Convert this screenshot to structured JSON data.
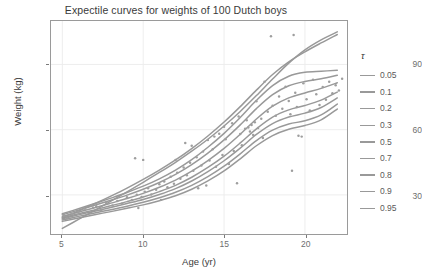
{
  "chart_data": {
    "type": "line",
    "title": "Expectile curves for weights of 100 Dutch boys",
    "xlabel": "Age (yr)",
    "ylabel": "Weight (kg)",
    "xlim": [
      4.3,
      22.6
    ],
    "ylim": [
      12,
      110
    ],
    "xticks": [
      5,
      10,
      15,
      20
    ],
    "yticks": [
      30,
      60,
      90
    ],
    "grid": true,
    "legend_position": "right",
    "legend_title": "τ",
    "line_color": "#999999",
    "point_color": "#9e9e9e",
    "panel_background": "#ffffff",
    "grid_color": "#ebebeb",
    "series": [
      {
        "name": "0.05",
        "tau": 0.05,
        "x": [
          5,
          6,
          7,
          8,
          9,
          10,
          11,
          12,
          13,
          14,
          15,
          16,
          17,
          18,
          19,
          20,
          21,
          22
        ],
        "values": [
          17.8,
          19.4,
          20.9,
          22.3,
          23.8,
          25.4,
          27.3,
          29.6,
          32.6,
          36.4,
          41.0,
          46.6,
          52.6,
          57.3,
          60.2,
          61.9,
          64.5,
          69.5
        ]
      },
      {
        "name": "0.1",
        "tau": 0.1,
        "x": [
          5,
          6,
          7,
          8,
          9,
          10,
          11,
          12,
          13,
          14,
          15,
          16,
          17,
          18,
          19,
          20,
          21,
          22
        ],
        "values": [
          18.4,
          20.1,
          21.7,
          23.2,
          24.8,
          26.6,
          28.7,
          31.2,
          34.4,
          38.4,
          43.2,
          48.9,
          55.0,
          59.8,
          62.6,
          64.1,
          66.8,
          71.8
        ]
      },
      {
        "name": "0.2",
        "tau": 0.2,
        "x": [
          5,
          6,
          7,
          8,
          9,
          10,
          11,
          12,
          13,
          14,
          15,
          16,
          17,
          18,
          19,
          20,
          21,
          22
        ],
        "values": [
          19.0,
          20.8,
          22.5,
          24.2,
          26.0,
          27.9,
          30.2,
          32.9,
          36.4,
          40.7,
          45.7,
          51.5,
          57.8,
          62.8,
          65.8,
          67.6,
          70.2,
          74.6
        ]
      },
      {
        "name": "0.3",
        "tau": 0.3,
        "x": [
          5,
          6,
          7,
          8,
          9,
          10,
          11,
          12,
          13,
          14,
          15,
          16,
          17,
          18,
          19,
          20,
          21,
          22
        ],
        "values": [
          19.4,
          21.3,
          23.1,
          25.0,
          26.9,
          29.0,
          31.5,
          34.4,
          38.1,
          42.6,
          47.8,
          53.9,
          60.4,
          65.8,
          69.1,
          71.1,
          73.6,
          77.3
        ]
      },
      {
        "name": "0.5",
        "tau": 0.5,
        "x": [
          5,
          6,
          7,
          8,
          9,
          10,
          11,
          12,
          13,
          14,
          15,
          16,
          17,
          18,
          19,
          20,
          21,
          22
        ],
        "values": [
          20.1,
          22.1,
          24.1,
          26.2,
          28.3,
          30.7,
          33.5,
          36.8,
          40.9,
          45.8,
          51.4,
          57.9,
          64.9,
          70.8,
          74.6,
          76.9,
          79.0,
          81.6
        ]
      },
      {
        "name": "0.7",
        "tau": 0.7,
        "x": [
          5,
          6,
          7,
          8,
          9,
          10,
          11,
          12,
          13,
          14,
          15,
          16,
          17,
          18,
          19,
          20,
          21,
          22
        ],
        "values": [
          20.8,
          23.0,
          25.2,
          27.5,
          29.9,
          32.6,
          35.7,
          39.4,
          43.9,
          49.2,
          55.3,
          62.2,
          69.7,
          76.1,
          80.2,
          82.2,
          83.4,
          85.0
        ]
      },
      {
        "name": "0.8",
        "tau": 0.8,
        "x": [
          5,
          6,
          7,
          8,
          9,
          10,
          11,
          12,
          13,
          14,
          15,
          16,
          17,
          18,
          19,
          20,
          21,
          22
        ],
        "values": [
          21.3,
          23.6,
          26.0,
          28.5,
          31.1,
          34.0,
          37.4,
          41.4,
          46.2,
          51.9,
          58.3,
          65.6,
          73.5,
          80.3,
          84.6,
          86.4,
          86.9,
          87.3
        ]
      },
      {
        "name": "0.9",
        "tau": 0.9,
        "x": [
          5,
          6,
          7,
          8,
          9,
          10,
          11,
          12,
          13,
          14,
          15,
          16,
          17,
          18,
          19,
          20,
          21,
          22
        ],
        "values": [
          19.6,
          22.6,
          25.9,
          29.4,
          33.1,
          37.1,
          41.4,
          46.1,
          51.3,
          57.1,
          63.5,
          70.6,
          78.2,
          85.4,
          91.2,
          95.8,
          99.9,
          103.8
        ]
      },
      {
        "name": "0.95",
        "tau": 0.95,
        "x": [
          5,
          6,
          7,
          8,
          9,
          10,
          11,
          12,
          13,
          14,
          15,
          16,
          17,
          18,
          19,
          20,
          21,
          22
        ],
        "values": [
          14.6,
          18.7,
          22.9,
          27.1,
          31.4,
          35.8,
          40.3,
          45.0,
          50.1,
          55.6,
          61.7,
          68.4,
          75.7,
          83.3,
          90.6,
          96.7,
          101.3,
          105.0
        ]
      }
    ],
    "scatter": {
      "name": "observations",
      "n": 100,
      "points": [
        [
          5.1,
          20.5
        ],
        [
          5.3,
          19.2
        ],
        [
          5.6,
          21.3
        ],
        [
          6.0,
          22.1
        ],
        [
          6.4,
          23.6
        ],
        [
          6.8,
          25.2
        ],
        [
          6.9,
          24.1
        ],
        [
          7.1,
          24.8
        ],
        [
          7.4,
          22.9
        ],
        [
          7.7,
          26.4
        ],
        [
          8.1,
          25.1
        ],
        [
          8.4,
          27.2
        ],
        [
          8.7,
          26.0
        ],
        [
          9.0,
          28.9
        ],
        [
          9.3,
          27.6
        ],
        [
          9.5,
          46.8
        ],
        [
          9.6,
          30.1
        ],
        [
          9.7,
          24.0
        ],
        [
          9.9,
          29.0
        ],
        [
          10.0,
          46.1
        ],
        [
          10.1,
          31.5
        ],
        [
          10.3,
          33.0
        ],
        [
          10.5,
          30.2
        ],
        [
          10.8,
          32.4
        ],
        [
          11.0,
          34.9
        ],
        [
          11.1,
          27.7
        ],
        [
          11.3,
          36.2
        ],
        [
          11.5,
          33.5
        ],
        [
          11.7,
          38.3
        ],
        [
          11.9,
          35.1
        ],
        [
          12.0,
          46.0
        ],
        [
          12.1,
          40.2
        ],
        [
          12.3,
          37.4
        ],
        [
          12.5,
          42.6
        ],
        [
          12.6,
          53.9
        ],
        [
          12.7,
          39.0
        ],
        [
          12.9,
          44.8
        ],
        [
          13.0,
          52.6
        ],
        [
          13.1,
          41.1
        ],
        [
          13.3,
          47.3
        ],
        [
          13.4,
          33.1
        ],
        [
          13.6,
          43.5
        ],
        [
          13.7,
          49.9
        ],
        [
          13.9,
          34.3
        ],
        [
          14.0,
          55.2
        ],
        [
          14.1,
          45.8
        ],
        [
          14.3,
          51.0
        ],
        [
          14.4,
          56.8
        ],
        [
          14.5,
          42.9
        ],
        [
          14.7,
          58.1
        ],
        [
          14.9,
          48.4
        ],
        [
          15.0,
          61.3
        ],
        [
          15.1,
          55.6
        ],
        [
          15.3,
          44.2
        ],
        [
          15.5,
          63.0
        ],
        [
          15.6,
          50.2
        ],
        [
          15.8,
          35.4
        ],
        [
          15.9,
          66.1
        ],
        [
          16.0,
          58.0
        ],
        [
          16.1,
          52.8
        ],
        [
          16.3,
          60.4
        ],
        [
          16.4,
          64.3
        ],
        [
          16.5,
          61.0
        ],
        [
          16.6,
          59.2
        ],
        [
          16.7,
          62.1
        ],
        [
          16.8,
          57.6
        ],
        [
          16.9,
          63.4
        ],
        [
          17.0,
          73.1
        ],
        [
          17.1,
          60.8
        ],
        [
          17.3,
          65.0
        ],
        [
          17.4,
          56.2
        ],
        [
          17.5,
          82.1
        ],
        [
          17.7,
          68.2
        ],
        [
          17.9,
          103.0
        ],
        [
          18.0,
          71.0
        ],
        [
          18.2,
          66.4
        ],
        [
          18.4,
          75.3
        ],
        [
          18.6,
          69.6
        ],
        [
          18.8,
          79.8
        ],
        [
          19.0,
          73.2
        ],
        [
          19.1,
          67.1
        ],
        [
          19.2,
          41.1
        ],
        [
          19.3,
          103.6
        ],
        [
          19.4,
          77.0
        ],
        [
          19.5,
          70.4
        ],
        [
          19.6,
          57.2
        ],
        [
          19.8,
          56.8
        ],
        [
          19.9,
          81.3
        ],
        [
          20.1,
          74.0
        ],
        [
          20.3,
          68.8
        ],
        [
          20.5,
          83.0
        ],
        [
          20.7,
          76.3
        ],
        [
          20.9,
          71.4
        ],
        [
          21.1,
          79.6
        ],
        [
          21.3,
          73.8
        ],
        [
          21.5,
          82.0
        ],
        [
          21.7,
          76.8
        ],
        [
          21.9,
          80.4
        ],
        [
          22.1,
          78.0
        ],
        [
          22.3,
          83.4
        ]
      ]
    }
  },
  "axes": {
    "y_tick_labels": [
      "90",
      "60",
      "30"
    ],
    "x_tick_labels": [
      "5",
      "10",
      "15",
      "20"
    ]
  },
  "legend": {
    "title": "τ",
    "items": [
      {
        "label": "0.05"
      },
      {
        "label": "0.1"
      },
      {
        "label": "0.2"
      },
      {
        "label": "0.3"
      },
      {
        "label": "0.5"
      },
      {
        "label": "0.7"
      },
      {
        "label": "0.8"
      },
      {
        "label": "0.9"
      },
      {
        "label": "0.95"
      }
    ]
  }
}
